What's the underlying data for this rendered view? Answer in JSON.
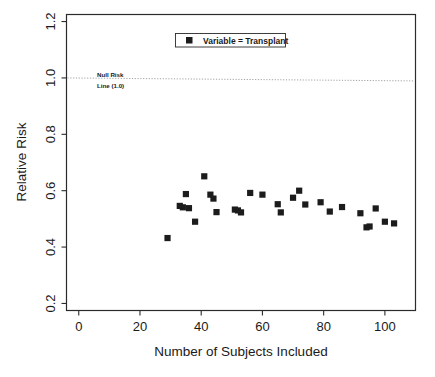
{
  "chart_data": {
    "type": "scatter",
    "title": "",
    "xlabel": "Number of Subjects Included",
    "ylabel": "Relative Risk",
    "xlim": [
      -4,
      110
    ],
    "ylim": [
      0.175,
      1.225
    ],
    "xticks": [
      0,
      20,
      40,
      60,
      80,
      100
    ],
    "xtick_labels": [
      "0",
      "20",
      "40",
      "60",
      "80",
      "100"
    ],
    "yticks": [
      0.2,
      0.4,
      0.6,
      0.8,
      1.0,
      1.2
    ],
    "ytick_labels": [
      "0.2",
      "0.4",
      "0.6",
      "0.8",
      "1.0",
      "1.2"
    ],
    "grid": false,
    "legend_position": "top-center",
    "series": [
      {
        "name": "Variable = Transplant",
        "marker": "square",
        "color": "#1c1c1c",
        "points": [
          {
            "x": 29,
            "y": 0.432
          },
          {
            "x": 33,
            "y": 0.546
          },
          {
            "x": 34,
            "y": 0.541
          },
          {
            "x": 35,
            "y": 0.588
          },
          {
            "x": 36,
            "y": 0.538
          },
          {
            "x": 38,
            "y": 0.49
          },
          {
            "x": 41,
            "y": 0.651
          },
          {
            "x": 43,
            "y": 0.586
          },
          {
            "x": 44,
            "y": 0.572
          },
          {
            "x": 45,
            "y": 0.524
          },
          {
            "x": 51,
            "y": 0.533
          },
          {
            "x": 52,
            "y": 0.53
          },
          {
            "x": 53,
            "y": 0.523
          },
          {
            "x": 56,
            "y": 0.592
          },
          {
            "x": 60,
            "y": 0.586
          },
          {
            "x": 65,
            "y": 0.552
          },
          {
            "x": 66,
            "y": 0.523
          },
          {
            "x": 70,
            "y": 0.575
          },
          {
            "x": 72,
            "y": 0.6
          },
          {
            "x": 74,
            "y": 0.551
          },
          {
            "x": 79,
            "y": 0.559
          },
          {
            "x": 82,
            "y": 0.526
          },
          {
            "x": 86,
            "y": 0.542
          },
          {
            "x": 92,
            "y": 0.52
          },
          {
            "x": 94,
            "y": 0.47
          },
          {
            "x": 95,
            "y": 0.473
          },
          {
            "x": 97,
            "y": 0.537
          },
          {
            "x": 100,
            "y": 0.49
          },
          {
            "x": 103,
            "y": 0.484
          }
        ]
      }
    ],
    "reference_line": {
      "value": 1.0,
      "orientation": "horizontal",
      "style": "dotted",
      "label_line1": "Null Risk",
      "label_line2": "Line (1.0)"
    }
  },
  "legend": {
    "entries": [
      {
        "label": "Variable = Transplant"
      }
    ]
  },
  "axes": {
    "x_title": "Number of Subjects Included",
    "y_title": "Relative Risk"
  }
}
